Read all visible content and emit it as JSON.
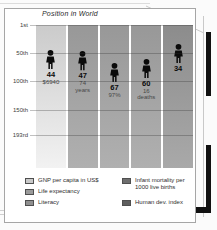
{
  "chart_data": {
    "type": "pictogram",
    "title": "Position in World",
    "y_axis": {
      "description": "world ranking, 1st at top",
      "min_rank": 1,
      "max_rank": 193,
      "ticks": [
        {
          "label": "1st",
          "rank": 1
        },
        {
          "label": "50th",
          "rank": 50
        },
        {
          "label": "100th",
          "rank": 100
        },
        {
          "label": "150th",
          "rank": 150
        },
        {
          "label": "193rd",
          "rank": 193
        }
      ]
    },
    "series": [
      {
        "indicator": "GNP per capita in US$",
        "rank": 44,
        "rank_label": "44",
        "sublabel_lines": [
          "$6940"
        ],
        "column_shade": "light"
      },
      {
        "indicator": "Life expectancy",
        "rank": 47,
        "rank_label": "47",
        "sublabel_lines": [
          "74",
          "years"
        ],
        "column_shade": "mid"
      },
      {
        "indicator": "Literacy",
        "rank": 67,
        "rank_label": "67",
        "sublabel_lines": [
          "97%"
        ],
        "column_shade": "mid"
      },
      {
        "indicator": "Infant mortality per 1000 live births",
        "rank": 60,
        "rank_label": "60",
        "sublabel_lines": [
          "16",
          "deaths"
        ],
        "column_shade": "mid"
      },
      {
        "indicator": "Human dev. index",
        "rank": 34,
        "rank_label": "34",
        "sublabel_lines": [],
        "column_shade": "dark"
      }
    ]
  },
  "legend": {
    "left_items": [
      {
        "label": "GNP per capita in US$",
        "color": "#c9c9c9"
      },
      {
        "label": "Life expectancy",
        "color": "#9a9a9a"
      },
      {
        "label": "Literacy",
        "color": "#8f8f8f"
      }
    ],
    "right_items": [
      {
        "label": "Infant mortality per 1000 live births",
        "color": "#6e6e6e"
      },
      {
        "label": "Human dev. index",
        "color": "#5e5e5e"
      }
    ]
  },
  "colors": {
    "panel_background": "#ffffff",
    "panel_border": "#a6a6a6",
    "column_light": "#cbcbcb",
    "column_mid": "#989898",
    "column_dark": "#8c8c8c",
    "figure_silhouette": "#0b0b0b",
    "page_edge_tab": "#111111"
  }
}
